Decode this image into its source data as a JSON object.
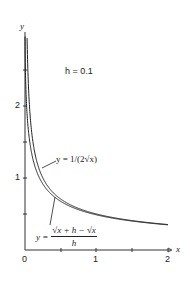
{
  "chart_data": {
    "type": "line",
    "title": "",
    "annotation": "h = 0.1",
    "xlabel": "x",
    "ylabel": "y",
    "xlim": [
      0,
      2
    ],
    "ylim": [
      0,
      3
    ],
    "x_ticks": [
      "0",
      "1",
      "2"
    ],
    "y_ticks": [
      "1",
      "2"
    ],
    "grid": false,
    "legend": "inline labels with pointer lines",
    "h": 0.1,
    "series": [
      {
        "name": "y = 1/(2√x)",
        "x": [
          0.03,
          0.05,
          0.1,
          0.2,
          0.3,
          0.5,
          0.75,
          1.0,
          1.5,
          2.0
        ],
        "values": [
          2.887,
          2.236,
          1.581,
          1.118,
          0.913,
          0.707,
          0.577,
          0.5,
          0.408,
          0.354
        ]
      },
      {
        "name": "y = (√(x+h) − √x)/h",
        "x": [
          0.0,
          0.05,
          0.1,
          0.2,
          0.3,
          0.5,
          0.75,
          1.0,
          1.5,
          2.0
        ],
        "values": [
          3.162,
          1.637,
          1.306,
          1.005,
          0.847,
          0.67,
          0.555,
          0.488,
          0.403,
          0.349
        ]
      }
    ]
  },
  "labels": {
    "annotation": "h = 0.1",
    "x_axis": "x",
    "y_axis": "y",
    "x_tick_0": "0",
    "x_tick_1": "1",
    "x_tick_2": "2",
    "y_tick_1": "1",
    "y_tick_2": "2",
    "eq1": "y = 1/(2√x)",
    "eq2_lhs": "y =",
    "eq2_num": "√x + h − √x",
    "eq2_den": "h"
  }
}
